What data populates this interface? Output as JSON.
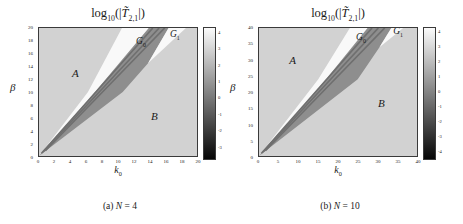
{
  "title_parts": {
    "log": "log",
    "base": "10",
    "open": "(|",
    "T": "T̃",
    "sub": "2,1",
    "close": "|)"
  },
  "chart_data": [
    {
      "type": "heatmap",
      "title": "log10(|T~_(2,1)|)",
      "caption_prefix": "(a) ",
      "caption_var": "N",
      "caption_rest": " = 4",
      "xlabel_main": "k",
      "xlabel_sub": "0",
      "ylabel": "β",
      "xlim": [
        0,
        20
      ],
      "ylim": [
        0,
        20
      ],
      "x_tick_labels": [
        "0",
        "2",
        "4",
        "6",
        "8",
        "10",
        "12",
        "14",
        "16",
        "18",
        "20"
      ],
      "y_tick_labels": [
        "20",
        "18",
        "16",
        "14",
        "12",
        "10",
        "8",
        "6",
        "4",
        "2",
        "0"
      ],
      "background_color": "#d2d2d2",
      "background_approx_value": 3,
      "regions": [
        {
          "name": "gap-wedge-G0",
          "approx_value": 4,
          "color": "#f9f9f9",
          "polygon": [
            [
              0,
              0
            ],
            [
              6.2,
              10
            ],
            [
              10.5,
              20
            ],
            [
              13.9,
              20
            ],
            [
              7.1,
              10
            ]
          ]
        },
        {
          "name": "dark-transmission-band",
          "approx_value": 0,
          "color": "#8e8e8e",
          "polygon": [
            [
              0,
              0
            ],
            [
              7.1,
              10
            ],
            [
              13.9,
              20
            ],
            [
              16.4,
              20
            ],
            [
              13.8,
              14.5
            ],
            [
              10.6,
              10
            ]
          ]
        },
        {
          "name": "gap-wedge-G1",
          "approx_value": 4,
          "color": "#f9f9f9",
          "polygon": [
            [
              13.8,
              14.5
            ],
            [
              16.4,
              20
            ],
            [
              18.6,
              20
            ]
          ]
        }
      ],
      "streaks": [
        [
          0.3,
          0.4,
          14.4,
          20
        ],
        [
          0.5,
          0.6,
          15.2,
          20
        ],
        [
          0.8,
          0.8,
          15.9,
          20
        ]
      ],
      "streak_color": "#6f6f6f",
      "streak_width": 0.22,
      "labels": [
        {
          "text": "A",
          "x": 4.6,
          "y": 13.0
        },
        {
          "text": "B",
          "x": 14.6,
          "y": 6.2
        },
        {
          "main": "G",
          "sub": "0",
          "x": 12.9,
          "y": 17.6
        },
        {
          "main": "G",
          "sub": "1",
          "x": 17.2,
          "y": 18.8
        }
      ],
      "colorbar": {
        "ticks": [
          "4",
          "3",
          "2",
          "1",
          "0",
          "-1",
          "-2",
          "-3"
        ],
        "vmax": 4.35,
        "vmin": -3.75,
        "top_color": "#fbfbfb",
        "bottom_color": "#060606"
      }
    },
    {
      "type": "heatmap",
      "title": "log10(|T~_(2,1)|)",
      "caption_prefix": "(b) ",
      "caption_var": "N",
      "caption_rest": " = 10",
      "xlabel_main": "k",
      "xlabel_sub": "0",
      "ylabel": "β",
      "xlim": [
        0,
        40
      ],
      "ylim": [
        0,
        40
      ],
      "x_tick_labels": [
        "0",
        "5",
        "10",
        "15",
        "20",
        "25",
        "30",
        "35",
        "40"
      ],
      "y_tick_labels": [
        "40",
        "35",
        "30",
        "25",
        "20",
        "15",
        "10",
        "5",
        "0"
      ],
      "background_color": "#d2d2d2",
      "background_approx_value": 3,
      "regions": [
        {
          "name": "gap-wedge-G0",
          "approx_value": 4,
          "color": "#f9f9f9",
          "polygon": [
            [
              0,
              0
            ],
            [
              15,
              24
            ],
            [
              23,
              40
            ],
            [
              27.5,
              40
            ],
            [
              17,
              24
            ]
          ]
        },
        {
          "name": "dark-transmission-band",
          "approx_value": 0,
          "color": "#8e8e8e",
          "polygon": [
            [
              0,
              0
            ],
            [
              17,
              24
            ],
            [
              27.5,
              40
            ],
            [
              33.5,
              40
            ],
            [
              30.5,
              34
            ],
            [
              25,
              24
            ]
          ]
        },
        {
          "name": "gap-wedge-G1",
          "approx_value": 4,
          "color": "#f9f9f9",
          "polygon": [
            [
              30.5,
              34
            ],
            [
              33.5,
              40
            ],
            [
              36.5,
              40
            ]
          ]
        }
      ],
      "streaks": [
        [
          0.6,
          0.8,
          28.6,
          40
        ],
        [
          1.0,
          1.2,
          30.2,
          40
        ],
        [
          1.6,
          1.6,
          31.8,
          40
        ]
      ],
      "streak_color": "#6f6f6f",
      "streak_width": 0.45,
      "labels": [
        {
          "text": "A",
          "x": 8.5,
          "y": 30.0
        },
        {
          "text": "B",
          "x": 31.0,
          "y": 16.5
        },
        {
          "main": "G",
          "sub": "0",
          "x": 25.8,
          "y": 36.6
        },
        {
          "main": "G",
          "sub": "1",
          "x": 35.2,
          "y": 38.4
        }
      ],
      "colorbar": {
        "ticks": [
          "4",
          "3",
          "2",
          "1",
          "0",
          "-1",
          "-2",
          "-3",
          "-4"
        ],
        "vmax": 4.3,
        "vmin": -4.55,
        "top_color": "#fbfbfb",
        "bottom_color": "#060606"
      }
    }
  ]
}
